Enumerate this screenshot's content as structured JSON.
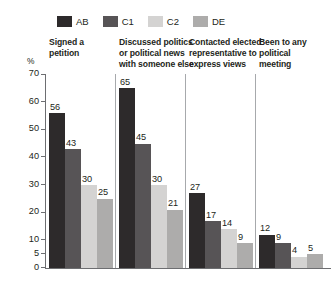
{
  "chart_data": {
    "type": "bar",
    "title": "",
    "subtitle": "",
    "xlabel": "",
    "ylabel": "%",
    "ylim": [
      0,
      70
    ],
    "grid": false,
    "legend_position": "top-left",
    "yticks": [
      0,
      5,
      10,
      20,
      30,
      40,
      50,
      60,
      70
    ],
    "ytick_labels": [
      "0",
      "5",
      "10",
      "20",
      "30",
      "40",
      "50",
      "60",
      "70"
    ],
    "categories": [
      "Signed a petition",
      "Discussed politics or political news with someone else",
      "Contacted elected representative to express views",
      "Been to any political meeting"
    ],
    "category_lines": [
      [
        "Signed a",
        "petition"
      ],
      [
        "Discussed politics",
        "or political news",
        "with someone else"
      ],
      [
        "Contacted elected",
        "representative to",
        "express views"
      ],
      [
        "Been to any",
        "political",
        "meeting"
      ]
    ],
    "series": [
      {
        "name": "AB",
        "color": "#2d2a2b",
        "values": [
          56,
          65,
          27,
          12
        ]
      },
      {
        "name": "C1",
        "color": "#575456",
        "values": [
          43,
          45,
          17,
          9
        ]
      },
      {
        "name": "C2",
        "color": "#d4d3d2",
        "values": [
          30,
          30,
          14,
          4
        ]
      },
      {
        "name": "DE",
        "color": "#adacab",
        "values": [
          25,
          21,
          9,
          5
        ]
      }
    ]
  },
  "legend": {
    "entries": [
      {
        "label": "AB",
        "color": "#2d2a2b"
      },
      {
        "label": "C1",
        "color": "#575456"
      },
      {
        "label": "C2",
        "color": "#d4d3d2"
      },
      {
        "label": "DE",
        "color": "#adacab"
      }
    ]
  },
  "axis": {
    "unit_label": "%"
  }
}
